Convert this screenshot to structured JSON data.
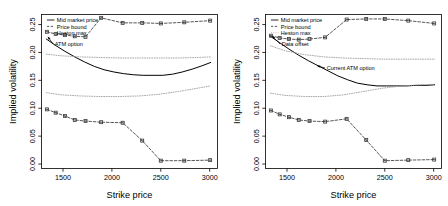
{
  "figure": {
    "panel_count": 2,
    "background": "#ffffff",
    "axis_color": "#000000"
  },
  "chart_data": [
    {
      "type": "line",
      "panel": "left",
      "title": "",
      "xlabel": "Strike price",
      "ylabel": "Implied volatility",
      "xlim": [
        1280,
        3080
      ],
      "ylim": [
        -0.008,
        0.268
      ],
      "xticks": [
        1500,
        2000,
        2500,
        3000
      ],
      "yticks": [
        0.0,
        0.05,
        0.1,
        0.15,
        0.2,
        0.25
      ],
      "ytick_labels": [
        "0.00",
        "0.05",
        "0.10",
        "0.15",
        "0.20",
        "0.25"
      ],
      "xtick_labels": [
        "1500",
        "2000",
        "2500",
        "3000"
      ],
      "grid": false,
      "legend": {
        "position": "top-left",
        "entries": [
          {
            "label": "Mid market price",
            "style": "solid",
            "color": "#000000"
          },
          {
            "label": "Price bound",
            "style": "dashed-marker",
            "color": "#3a3a3a"
          },
          {
            "label": "Heston max",
            "style": "dotted",
            "color": "#9a9a9a"
          }
        ]
      },
      "annotations": [
        {
          "text": "ATM option",
          "x": 1400,
          "y": 0.215,
          "arrow_to_x": 1345,
          "arrow_to_y": 0.228
        }
      ],
      "series": [
        {
          "name": "Mid market price",
          "style": "solid",
          "color": "#000000",
          "x": [
            1330,
            1420,
            1520,
            1620,
            1720,
            1820,
            1920,
            2020,
            2120,
            2220,
            2320,
            2420,
            2520,
            2620,
            2720,
            2820,
            2920,
            3010
          ],
          "y": [
            0.224,
            0.213,
            0.202,
            0.192,
            0.183,
            0.175,
            0.169,
            0.165,
            0.162,
            0.16,
            0.159,
            0.159,
            0.159,
            0.161,
            0.165,
            0.17,
            0.176,
            0.182
          ]
        },
        {
          "name": "Price bound upper",
          "style": "dashed-marker",
          "color": "#3a3a3a",
          "x": [
            1335,
            1425,
            1520,
            1620,
            1730,
            1890,
            2110,
            2310,
            2500,
            2740,
            3005
          ],
          "y": [
            0.237,
            0.233,
            0.231,
            0.229,
            0.228,
            0.262,
            0.253,
            0.253,
            0.252,
            0.254,
            0.257
          ]
        },
        {
          "name": "Price bound lower",
          "style": "dashed-marker",
          "color": "#3a3a3a",
          "x": [
            1335,
            1425,
            1520,
            1620,
            1730,
            1890,
            2110,
            2310,
            2500,
            2740,
            3005
          ],
          "y": [
            0.098,
            0.092,
            0.086,
            0.079,
            0.077,
            0.075,
            0.074,
            0.042,
            0.006,
            0.006,
            0.007
          ]
        },
        {
          "name": "Heston max",
          "style": "dotted",
          "color": "#9a9a9a",
          "x": [
            1330,
            1480,
            1680,
            1880,
            2080,
            2280,
            2480,
            2680,
            2880,
            3010
          ],
          "y": [
            0.197,
            0.194,
            0.192,
            0.191,
            0.19,
            0.19,
            0.19,
            0.19,
            0.191,
            0.192
          ]
        },
        {
          "name": "Heston min",
          "style": "dotted",
          "color": "#9a9a9a",
          "x": [
            1330,
            1480,
            1680,
            1880,
            2080,
            2280,
            2480,
            2680,
            2880,
            3010
          ],
          "y": [
            0.128,
            0.124,
            0.122,
            0.121,
            0.121,
            0.122,
            0.125,
            0.13,
            0.136,
            0.14
          ]
        }
      ]
    },
    {
      "type": "line",
      "panel": "right",
      "title": "",
      "xlabel": "Strike price",
      "ylabel": "Implied volatility",
      "xlim": [
        1280,
        3080
      ],
      "ylim": [
        -0.008,
        0.268
      ],
      "xticks": [
        1500,
        2000,
        2500,
        3000
      ],
      "yticks": [
        0.0,
        0.05,
        0.1,
        0.15,
        0.2,
        0.25
      ],
      "ytick_labels": [
        "0.00",
        "0.05",
        "0.10",
        "0.15",
        "0.20",
        "0.25"
      ],
      "xtick_labels": [
        "1500",
        "2000",
        "2500",
        "3000"
      ],
      "grid": false,
      "legend": {
        "position": "top-left",
        "entries": [
          {
            "label": "Mid market price",
            "style": "solid",
            "color": "#000000"
          },
          {
            "label": "Price bound",
            "style": "dashed-marker",
            "color": "#3a3a3a"
          },
          {
            "label": "Heston max",
            "style": "dotted",
            "color": "#9a9a9a"
          }
        ]
      },
      "annotations": [
        {
          "text": "Data offset",
          "x": 1430,
          "y": 0.215,
          "arrow_to_x": 1350,
          "arrow_to_y": 0.229
        },
        {
          "text": "Current ATM option",
          "x": 1890,
          "y": 0.172,
          "arrow_to_x": 1810,
          "arrow_to_y": 0.176
        }
      ],
      "series": [
        {
          "name": "Mid market price",
          "style": "solid",
          "color": "#000000",
          "x": [
            1330,
            1420,
            1520,
            1620,
            1720,
            1820,
            1920,
            2020,
            2120,
            2220,
            2320,
            2420,
            2520,
            2620,
            2720,
            2820,
            2920,
            3010
          ],
          "y": [
            0.229,
            0.218,
            0.206,
            0.195,
            0.185,
            0.176,
            0.167,
            0.158,
            0.151,
            0.145,
            0.142,
            0.14,
            0.14,
            0.14,
            0.14,
            0.141,
            0.141,
            0.142
          ]
        },
        {
          "name": "Price bound upper",
          "style": "dashed-marker",
          "color": "#3a3a3a",
          "x": [
            1335,
            1425,
            1520,
            1620,
            1730,
            1890,
            2110,
            2310,
            2500,
            2740,
            3005
          ],
          "y": [
            0.23,
            0.226,
            0.224,
            0.223,
            0.224,
            0.227,
            0.259,
            0.26,
            0.26,
            0.257,
            0.252
          ]
        },
        {
          "name": "Price bound lower",
          "style": "dashed-marker",
          "color": "#3a3a3a",
          "x": [
            1335,
            1425,
            1520,
            1620,
            1730,
            1890,
            2110,
            2310,
            2500,
            2740,
            3005
          ],
          "y": [
            0.096,
            0.089,
            0.084,
            0.079,
            0.077,
            0.076,
            0.081,
            0.043,
            0.006,
            0.007,
            0.008
          ]
        },
        {
          "name": "Heston max",
          "style": "dotted",
          "color": "#9a9a9a",
          "x": [
            1330,
            1480,
            1680,
            1880,
            2080,
            2280,
            2480,
            2680,
            2880,
            3010
          ],
          "y": [
            0.212,
            0.203,
            0.196,
            0.192,
            0.19,
            0.189,
            0.188,
            0.188,
            0.188,
            0.188
          ]
        },
        {
          "name": "Heston min",
          "style": "dotted",
          "color": "#9a9a9a",
          "x": [
            1330,
            1480,
            1680,
            1880,
            2080,
            2280,
            2480,
            2680,
            2880,
            3010
          ],
          "y": [
            0.127,
            0.123,
            0.121,
            0.121,
            0.124,
            0.13,
            0.136,
            0.14,
            0.142,
            0.143
          ]
        }
      ]
    }
  ]
}
